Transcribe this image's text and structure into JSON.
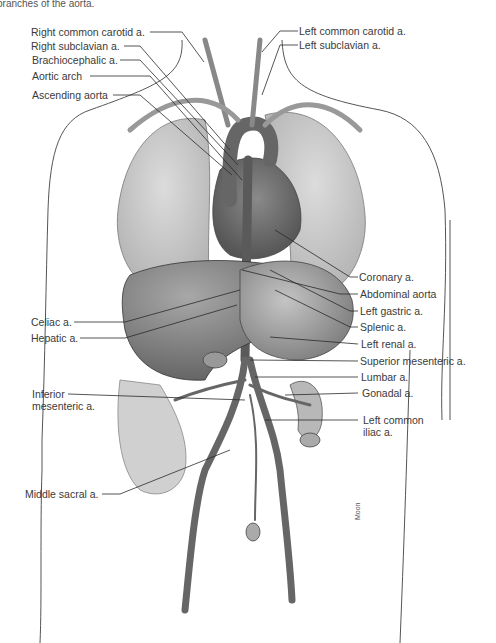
{
  "caption": "branches of the aorta.",
  "signature": "Moon",
  "labels_left": [
    {
      "id": "right-common-carotid",
      "text": "Right common carotid a.",
      "x": 31,
      "y": 28
    },
    {
      "id": "right-subclavian",
      "text": "Right subclavian a.",
      "x": 31,
      "y": 42
    },
    {
      "id": "brachiocephalic",
      "text": "Brachiocephalic a.",
      "x": 32,
      "y": 56
    },
    {
      "id": "aortic-arch",
      "text": "Aortic arch",
      "x": 32,
      "y": 72
    },
    {
      "id": "ascending-aorta",
      "text": "Ascending aorta",
      "x": 32,
      "y": 91
    },
    {
      "id": "celiac",
      "text": "Celiac a.",
      "x": 31,
      "y": 318
    },
    {
      "id": "hepatic",
      "text": "Hepatic a.",
      "x": 31,
      "y": 334
    },
    {
      "id": "inferior-mesenteric-1",
      "text": "Inferior",
      "x": 32,
      "y": 390
    },
    {
      "id": "inferior-mesenteric-2",
      "text": "mesenteric a.",
      "x": 32,
      "y": 402
    },
    {
      "id": "middle-sacral",
      "text": "Middle sacral a.",
      "x": 25,
      "y": 490
    }
  ],
  "labels_right": [
    {
      "id": "left-common-carotid",
      "text": "Left common carotid a.",
      "x": 299,
      "y": 27
    },
    {
      "id": "left-subclavian",
      "text": "Left subclavian a.",
      "x": 299,
      "y": 41
    },
    {
      "id": "coronary",
      "text": "Coronary a.",
      "x": 359,
      "y": 273
    },
    {
      "id": "abdominal-aorta",
      "text": "Abdominal aorta",
      "x": 360,
      "y": 290
    },
    {
      "id": "left-gastric",
      "text": "Left gastric a.",
      "x": 360,
      "y": 307
    },
    {
      "id": "splenic",
      "text": "Splenic a.",
      "x": 360,
      "y": 323
    },
    {
      "id": "left-renal",
      "text": "Left renal a.",
      "x": 361,
      "y": 340
    },
    {
      "id": "superior-mesenteric",
      "text": "Superior mesenteric a.",
      "x": 360,
      "y": 357
    },
    {
      "id": "lumbar",
      "text": "Lumbar a.",
      "x": 361,
      "y": 373
    },
    {
      "id": "gonadal",
      "text": "Gonadal a.",
      "x": 362,
      "y": 389
    },
    {
      "id": "left-common-iliac-1",
      "text": "Left common",
      "x": 363,
      "y": 416
    },
    {
      "id": "left-common-iliac-2",
      "text": "iliac a.",
      "x": 363,
      "y": 428
    }
  ],
  "colors": {
    "line": "#2a2a2a",
    "organ_dark": "#6e6e6e",
    "organ_mid": "#9a9a9a",
    "organ_light": "#cfcfcf",
    "outline": "#555555"
  }
}
